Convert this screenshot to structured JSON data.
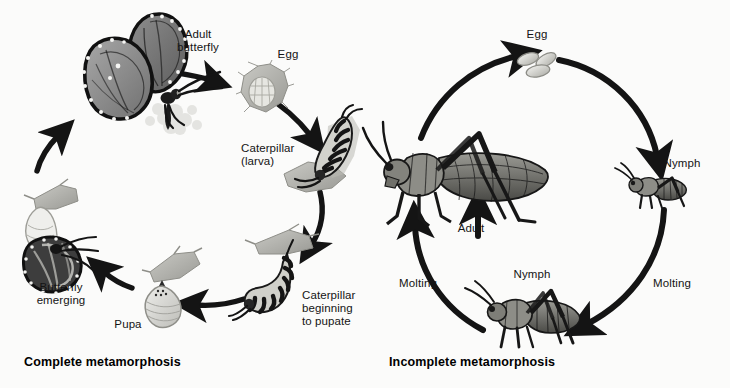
{
  "figure": {
    "background_color": "#fbfbfa",
    "ink_color": "#141414",
    "width": 730,
    "height": 388
  },
  "panels": [
    {
      "id": "complete-metamorphosis",
      "title": "Complete metamorphosis",
      "organism": "butterfly",
      "stages": [
        {
          "key": "adult-butterfly",
          "label": "Adult\nbutterfly",
          "icon": "butterfly-icon"
        },
        {
          "key": "egg",
          "label": "Egg",
          "icon": "butterfly-egg-icon"
        },
        {
          "key": "caterpillar-larva",
          "label": "Caterpillar\n(larva)",
          "icon": "caterpillar-icon"
        },
        {
          "key": "caterpillar-pupating",
          "label": "Caterpillar\nbeginning\nto pupate",
          "icon": "caterpillar-hanging-icon"
        },
        {
          "key": "pupa",
          "label": "Pupa",
          "icon": "chrysalis-icon"
        },
        {
          "key": "butterfly-emerging",
          "label": "Butterfly\nemerging",
          "icon": "emerging-butterfly-icon"
        }
      ],
      "transitions": [
        {
          "from": "adult-butterfly",
          "to": "egg",
          "label": ""
        },
        {
          "from": "egg",
          "to": "caterpillar-larva",
          "label": ""
        },
        {
          "from": "caterpillar-larva",
          "to": "caterpillar-pupating",
          "label": ""
        },
        {
          "from": "caterpillar-pupating",
          "to": "pupa",
          "label": ""
        },
        {
          "from": "pupa",
          "to": "butterfly-emerging",
          "label": ""
        },
        {
          "from": "butterfly-emerging",
          "to": "adult-butterfly",
          "label": ""
        }
      ]
    },
    {
      "id": "incomplete-metamorphosis",
      "title": "Incomplete metamorphosis",
      "organism": "grasshopper",
      "stages": [
        {
          "key": "egg",
          "label": "Egg",
          "icon": "grasshopper-eggs-icon"
        },
        {
          "key": "nymph-early",
          "label": "Nymph",
          "icon": "grasshopper-nymph-small-icon"
        },
        {
          "key": "nymph-late",
          "label": "Nymph",
          "icon": "grasshopper-nymph-large-icon"
        },
        {
          "key": "adult",
          "label": "Adult",
          "icon": "grasshopper-adult-icon"
        }
      ],
      "transitions": [
        {
          "from": "egg",
          "to": "nymph-early",
          "label": ""
        },
        {
          "from": "nymph-early",
          "to": "nymph-late",
          "label": "Molting"
        },
        {
          "from": "nymph-late",
          "to": "adult",
          "label": "Molting"
        },
        {
          "from": "adult",
          "to": "egg",
          "label": ""
        }
      ]
    }
  ]
}
